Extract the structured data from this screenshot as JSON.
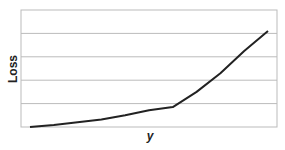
{
  "chart_data": {
    "type": "line",
    "title": "",
    "xlabel": "y",
    "ylabel": "Loss",
    "grid": true,
    "legend": null,
    "xlim": [
      0,
      10
    ],
    "ylim": [
      0,
      5
    ],
    "x": [
      0,
      1,
      2,
      3,
      4,
      5,
      6,
      7,
      8,
      9,
      10
    ],
    "series": [
      {
        "name": "Loss",
        "values": [
          0.0,
          0.08,
          0.2,
          0.32,
          0.5,
          0.72,
          0.85,
          1.5,
          2.3,
          3.25,
          4.1
        ]
      }
    ],
    "x_tick_labels": [],
    "y_tick_labels": [],
    "colors": {
      "line": "#222222",
      "grid": "#bbbbbb",
      "frame": "#bbbbbb"
    }
  }
}
